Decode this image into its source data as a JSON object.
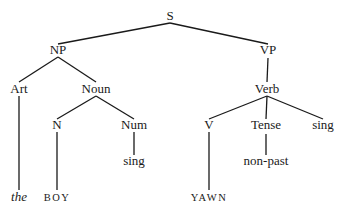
{
  "diagram": {
    "type": "syntax-tree",
    "nodes": [
      {
        "id": "s",
        "label": "S",
        "style": "normal"
      },
      {
        "id": "np",
        "label": "NP",
        "style": "normal"
      },
      {
        "id": "vp",
        "label": "VP",
        "style": "normal"
      },
      {
        "id": "art",
        "label": "Art",
        "style": "normal"
      },
      {
        "id": "noun",
        "label": "Noun",
        "style": "normal"
      },
      {
        "id": "verb",
        "label": "Verb",
        "style": "normal"
      },
      {
        "id": "n",
        "label": "N",
        "style": "normal"
      },
      {
        "id": "num",
        "label": "Num",
        "style": "normal"
      },
      {
        "id": "v",
        "label": "V",
        "style": "normal"
      },
      {
        "id": "tense",
        "label": "Tense",
        "style": "normal"
      },
      {
        "id": "sing2",
        "label": "sing",
        "style": "normal"
      },
      {
        "id": "sing1",
        "label": "sing",
        "style": "normal"
      },
      {
        "id": "nonpast",
        "label": "non-past",
        "style": "normal"
      },
      {
        "id": "the",
        "label": "the",
        "style": "italic"
      },
      {
        "id": "boy",
        "label": "BOY",
        "style": "smallcaps"
      },
      {
        "id": "yawn",
        "label": "YAWN",
        "style": "smallcaps"
      }
    ],
    "edges": [
      [
        "s",
        "np"
      ],
      [
        "s",
        "vp"
      ],
      [
        "np",
        "art"
      ],
      [
        "np",
        "noun"
      ],
      [
        "vp",
        "verb"
      ],
      [
        "art",
        "the"
      ],
      [
        "noun",
        "n"
      ],
      [
        "noun",
        "num"
      ],
      [
        "n",
        "boy"
      ],
      [
        "num",
        "sing1"
      ],
      [
        "verb",
        "v"
      ],
      [
        "verb",
        "tense"
      ],
      [
        "verb",
        "sing2"
      ],
      [
        "v",
        "yawn"
      ],
      [
        "tense",
        "nonpast"
      ]
    ]
  }
}
